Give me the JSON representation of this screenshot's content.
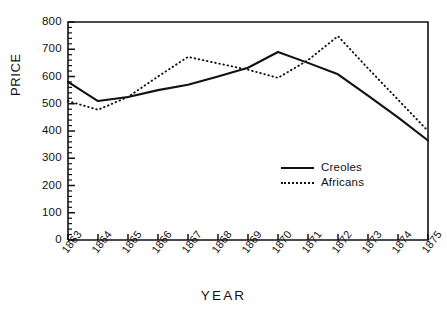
{
  "chart_data": {
    "type": "line",
    "title": "",
    "xlabel": "YEAR",
    "ylabel": "PRICE",
    "categories": [
      "1863",
      "1864",
      "1865",
      "1866",
      "1867",
      "1868",
      "1869",
      "1870",
      "1871",
      "1872",
      "1873",
      "1874",
      "1875"
    ],
    "x": [
      1863,
      1864,
      1865,
      1866,
      1867,
      1868,
      1869,
      1870,
      1871,
      1872,
      1873,
      1874,
      1875
    ],
    "ylim": [
      0,
      800
    ],
    "yticks": [
      0,
      100,
      200,
      300,
      400,
      500,
      600,
      700,
      800
    ],
    "ytick_labels": [
      "0",
      "100",
      "200",
      "300",
      "400",
      "500",
      "600",
      "700",
      "800"
    ],
    "grid": false,
    "legend_position": "center-right",
    "series": [
      {
        "name": "Creoles",
        "style": "solid",
        "color": "#111111",
        "values": [
          580,
          510,
          525,
          550,
          570,
          600,
          632,
          690,
          650,
          608,
          530,
          450,
          365
        ]
      },
      {
        "name": "Africans",
        "style": "dotted",
        "color": "#111111",
        "values": [
          510,
          478,
          525,
          600,
          672,
          648,
          625,
          595,
          660,
          748,
          630,
          515,
          400
        ]
      }
    ]
  },
  "legend": {
    "items": [
      {
        "label": "Creoles",
        "style": "solid"
      },
      {
        "label": "Africans",
        "style": "dotted"
      }
    ]
  },
  "axes": {
    "y_title": "PRICE",
    "x_title": "YEAR"
  }
}
